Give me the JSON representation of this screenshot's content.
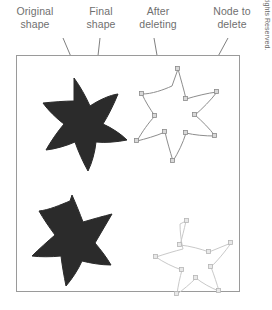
{
  "figure": {
    "labels": {
      "original_shape": "Original\nshape",
      "final_shape": "Final\nshape",
      "after_deleting": "After\ndeleting",
      "node_to_delete": "Node to\ndelete"
    },
    "credit": "Source: Corel® Corporation. ©2013 Cengage Learning®, All Rights Reserved.",
    "colors": {
      "filled_shape": "#2b2b2b",
      "outline_shape": "#8d8d8d",
      "outline_shape_light": "#c9c9c9",
      "node_fill": "#d8d8d8",
      "node_stroke": "#8a8a8a",
      "leader_line": "#707070",
      "frame_border": "#9a9a9a",
      "label_text": "#6f6f6f",
      "background": "#ffffff"
    },
    "frame": {
      "x": 16,
      "y": 55,
      "width": 224,
      "height": 237
    },
    "shapes": [
      {
        "name": "original-shape-starfish",
        "style": "filled",
        "position": "top-left",
        "node_count": 0
      },
      {
        "name": "final-shape-starfish",
        "style": "filled",
        "position": "bottom-left",
        "node_count": 0
      },
      {
        "name": "after-deleting-starfish",
        "style": "outlined-with-nodes",
        "position": "top-right",
        "node_count": 10
      },
      {
        "name": "node-deleted-starfish",
        "style": "outlined-with-nodes-light",
        "position": "bottom-right",
        "node_count": 9
      }
    ]
  }
}
